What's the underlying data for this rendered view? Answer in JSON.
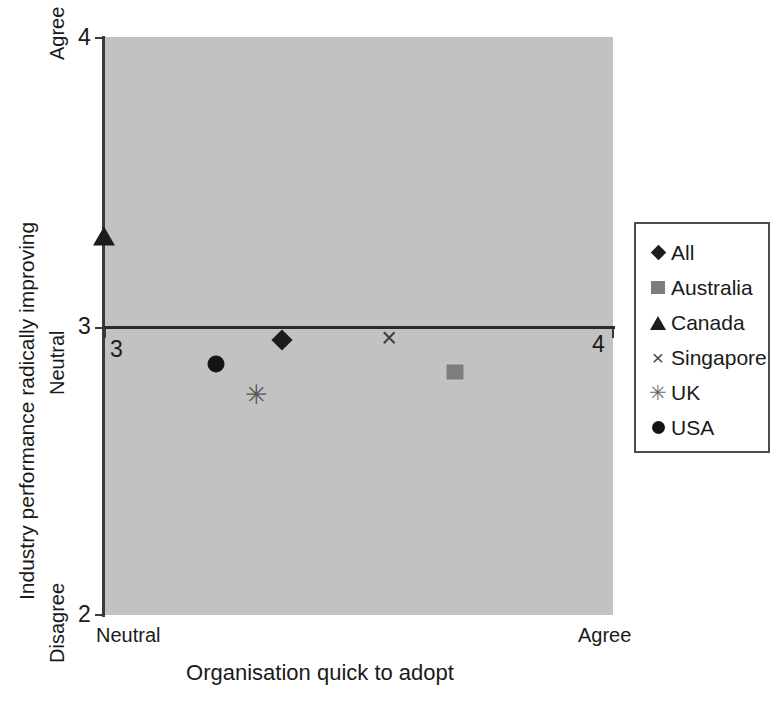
{
  "chart_data": {
    "type": "scatter",
    "title": "",
    "xlabel": "Organisation quick to adopt",
    "ylabel": "Industry performance radically improving",
    "xlim": [
      3,
      4
    ],
    "ylim": [
      2,
      4
    ],
    "x_tick_values": [
      "3",
      "4"
    ],
    "y_tick_values": [
      "4",
      "3",
      "2"
    ],
    "x_category_labels": [
      "Neutral",
      "Agree"
    ],
    "y_category_labels": [
      "Agree",
      "Neutral",
      "Disagree"
    ],
    "grid": false,
    "legend_position": "right",
    "plot_background": "#c2c2c2",
    "reference_line_y": 3,
    "series": [
      {
        "name": "All",
        "marker": "diamond",
        "color": "#1c1c1c",
        "x": 3.35,
        "y": 2.95
      },
      {
        "name": "Australia",
        "marker": "square",
        "color": "#7d7d7d",
        "x": 3.69,
        "y": 2.84
      },
      {
        "name": "Canada",
        "marker": "triangle",
        "color": "#1c1c1c",
        "x": 3.0,
        "y": 3.31
      },
      {
        "name": "Singapore",
        "marker": "x",
        "color": "#3d3d3d",
        "x": 3.56,
        "y": 2.96
      },
      {
        "name": "UK",
        "marker": "star",
        "color": "#585858",
        "x": 3.3,
        "y": 2.76
      },
      {
        "name": "USA",
        "marker": "circle",
        "color": "#151515",
        "x": 3.22,
        "y": 2.87
      }
    ]
  },
  "axes": {
    "y_top_tick": "4",
    "y_mid_tick": "3",
    "y_bottom_tick": "2",
    "x_left_tick": "3",
    "x_right_tick": "4",
    "y_top_word": "Agree",
    "y_mid_word": "Neutral",
    "y_bottom_word": "Disagree",
    "x_left_word": "Neutral",
    "x_right_word": "Agree",
    "y_title": "Industry performance radically improving",
    "x_title": "Organisation quick to adopt"
  },
  "legend": {
    "items": [
      {
        "label": "All",
        "glyph": "diamond-marker-icon"
      },
      {
        "label": "Australia",
        "glyph": "square-marker-icon"
      },
      {
        "label": "Canada",
        "glyph": "triangle-marker-icon"
      },
      {
        "label": "Singapore",
        "glyph": "x-marker-icon",
        "char": "×"
      },
      {
        "label": "UK",
        "glyph": "star-marker-icon",
        "char": "✳"
      },
      {
        "label": "USA",
        "glyph": "circle-marker-icon"
      }
    ]
  }
}
